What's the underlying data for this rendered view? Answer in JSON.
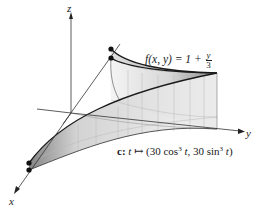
{
  "figure": {
    "type": "3d-surface-diagram",
    "axes": {
      "x_label": "x",
      "y_label": "y",
      "z_label": "z"
    },
    "function_label": {
      "lhs": "f(x, y) = 1 + ",
      "frac_num": "y",
      "frac_den": "3"
    },
    "curve_label": {
      "name": "c:",
      "map_var": "t",
      "arrow": "↦",
      "open": "(30 cos",
      "exp1": "3",
      "mid1": " ",
      "var1": "t",
      "sep": ", 30 sin",
      "exp2": "3",
      "mid2": " ",
      "var2": "t",
      "close": ")"
    },
    "colors": {
      "line": "#1a1a1a",
      "surface_light": "#f2f2f2",
      "surface_dark": "#8a8a8a",
      "grid": "#bdbdbd"
    }
  }
}
